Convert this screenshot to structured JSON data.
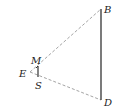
{
  "diagram": {
    "type": "geometry",
    "points": {
      "B": {
        "label": "B",
        "x": 101,
        "y": 9
      },
      "D": {
        "label": "D",
        "x": 101,
        "y": 100
      },
      "E": {
        "label": "E",
        "x": 30,
        "y": 72
      },
      "M": {
        "label": "M",
        "x": 38,
        "y": 66
      },
      "S": {
        "label": "S",
        "x": 38,
        "y": 77
      }
    },
    "segments": [
      {
        "from": "B",
        "to": "D",
        "style": "solid"
      },
      {
        "from": "M",
        "to": "S",
        "style": "solid"
      },
      {
        "from": "E",
        "to": "B",
        "style": "dashed"
      },
      {
        "from": "E",
        "to": "D",
        "style": "dashed"
      }
    ],
    "colors": {
      "solid": "#333333",
      "dashed": "#999999"
    }
  }
}
